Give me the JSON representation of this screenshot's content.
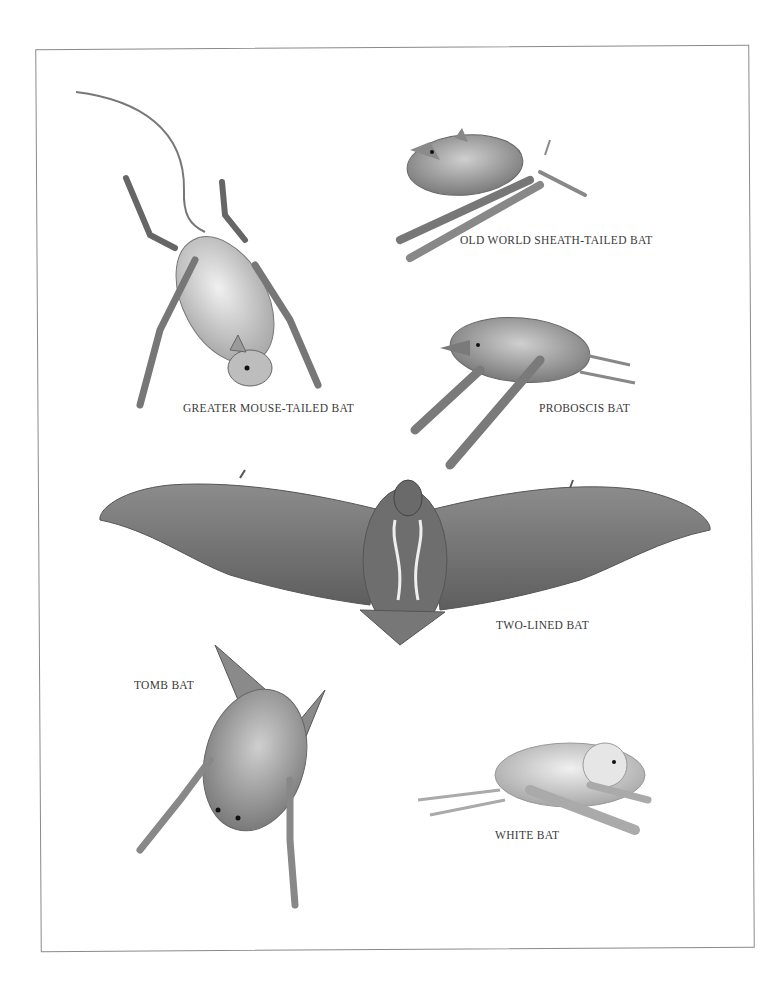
{
  "plate": {
    "background": "#ffffff",
    "border_color": "#8a8a8a",
    "ink_color": "#3a3a3a"
  },
  "specimens": [
    {
      "id": "greater-mouse-tailed-bat",
      "label": "GREATER MOUSE-TAILED BAT",
      "pose": "hanging upside down, long tail curving up-left"
    },
    {
      "id": "old-world-sheath-tailed-bat",
      "label": "OLD WORLD SHEATH-TAILED BAT",
      "pose": "crouched, facing left"
    },
    {
      "id": "proboscis-bat",
      "label": "PROBOSCIS BAT",
      "pose": "crouched, facing left, elongated snout"
    },
    {
      "id": "two-lined-bat",
      "label": "TWO-LINED BAT",
      "pose": "wings spread, dorsal view with two pale stripes"
    },
    {
      "id": "tomb-bat",
      "label": "TOMB BAT",
      "pose": "hanging, face down"
    },
    {
      "id": "white-bat",
      "label": "WHITE BAT",
      "pose": "crouched, facing right"
    }
  ]
}
